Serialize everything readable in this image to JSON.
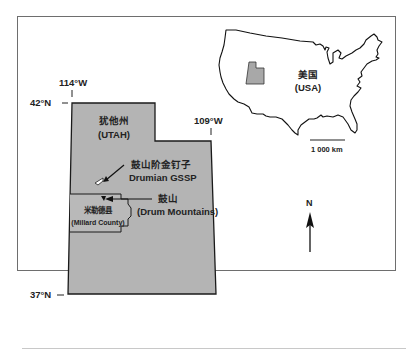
{
  "figure": {
    "type": "location-map",
    "colors": {
      "state_fill": "#b4b4b4",
      "outline": "#1a1a1a",
      "frame": "#6e6e6e",
      "background": "#ffffff"
    }
  },
  "graticule": {
    "lon_west": "114°W",
    "lon_east": "109°W",
    "lat_north": "42°N",
    "lat_south": "37°N"
  },
  "utah": {
    "name_cn": "犹他州",
    "name_en": "(UTAH)"
  },
  "gssp": {
    "label_cn": "鼓山阶金钉子",
    "label_en": "Drumian GSSP"
  },
  "drum_mountains": {
    "label_cn": "鼓山",
    "label_en": "(Drum Mountains)"
  },
  "millard_county": {
    "label_cn": "米勒德县",
    "label_en": "(Millard County)"
  },
  "inset": {
    "country_cn": "美国",
    "country_en": "(USA)",
    "scale_label": "1 000 km"
  },
  "north_arrow": {
    "label": "N"
  }
}
